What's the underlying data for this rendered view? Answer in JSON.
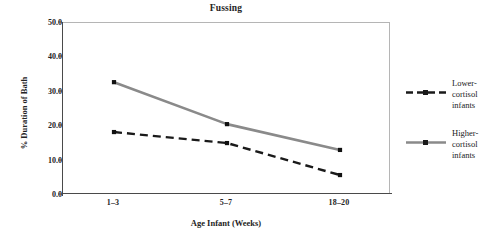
{
  "chart_data": {
    "type": "line",
    "title": "Fussing",
    "xlabel": "Age Infant (Weeks)",
    "ylabel": "% Duration of Bath",
    "categories": [
      "1–3",
      "5–7",
      "18–20"
    ],
    "ylim": [
      0.0,
      50.0
    ],
    "yticks": [
      "0.0",
      "10.0",
      "20.0",
      "30.0",
      "40.0",
      "50.0"
    ],
    "ytick_values": [
      0.0,
      10.0,
      20.0,
      30.0,
      40.0,
      50.0
    ],
    "grid": false,
    "legend_position": "right",
    "series": [
      {
        "name": "Lower-cortisol infants",
        "label_lines": [
          "Lower-",
          "cortisol",
          "infants"
        ],
        "values": [
          18.3,
          15.1,
          5.8
        ],
        "color": "#1a1a1a",
        "style": "dashed",
        "marker": "square"
      },
      {
        "name": "Higher-cortisol infants",
        "label_lines": [
          "Higher-",
          "cortisol",
          "infants"
        ],
        "values": [
          32.8,
          20.6,
          13.1
        ],
        "color": "#8a8a8a",
        "style": "solid",
        "marker": "square"
      }
    ]
  },
  "legend": {
    "entries": [
      {
        "label": "Lower-cortisol infants",
        "text": "Lower-\ncortisol\ninfants"
      },
      {
        "label": "Higher-cortisol infants",
        "text": "Higher-\ncortisol\ninfants"
      }
    ]
  }
}
